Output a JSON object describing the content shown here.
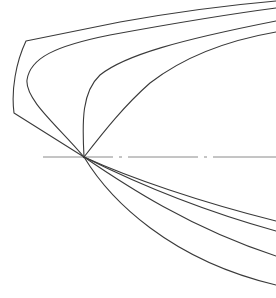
{
  "diagram": {
    "type": "line-drawing",
    "colors": {
      "background": "#ffffff",
      "stroke": "#3a3a3a",
      "centerline": "#8a8a8a"
    },
    "convergence_point": {
      "x": 84,
      "y": 157
    },
    "centerline": {
      "y": 157,
      "x_start": 43,
      "x_end": 276,
      "style": "dash-dot"
    },
    "upper_curves": [
      {
        "name": "outer-boundary",
        "right_edge_y": 1
      },
      {
        "name": "upper-curve-2",
        "right_edge_y": 8
      },
      {
        "name": "upper-curve-3",
        "right_edge_y": 21
      },
      {
        "name": "upper-curve-4",
        "right_edge_y": 32
      }
    ],
    "lower_curves": [
      {
        "name": "lower-curve-1",
        "right_edge_y": 221
      },
      {
        "name": "lower-curve-2",
        "right_edge_y": 231
      },
      {
        "name": "lower-curve-3",
        "right_edge_y": 256
      },
      {
        "name": "lower-curve-4",
        "right_edge_y": 285
      }
    ],
    "text_labels": []
  }
}
